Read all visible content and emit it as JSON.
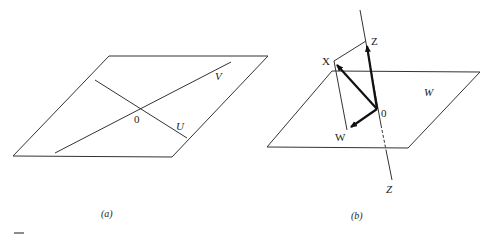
{
  "figure_a": {
    "caption": "(a)",
    "origin_label": "0",
    "line_v_label": "V",
    "line_u_label": "U"
  },
  "figure_b": {
    "caption": "(b)",
    "plane_label": "W",
    "axis_label": "Z",
    "point_z_label": "Z",
    "point_x_label": "X",
    "point_w_label": "W",
    "origin_label": "0"
  },
  "colors": {
    "line": "#333333",
    "arrow": "#111111",
    "background": "#ffffff"
  }
}
